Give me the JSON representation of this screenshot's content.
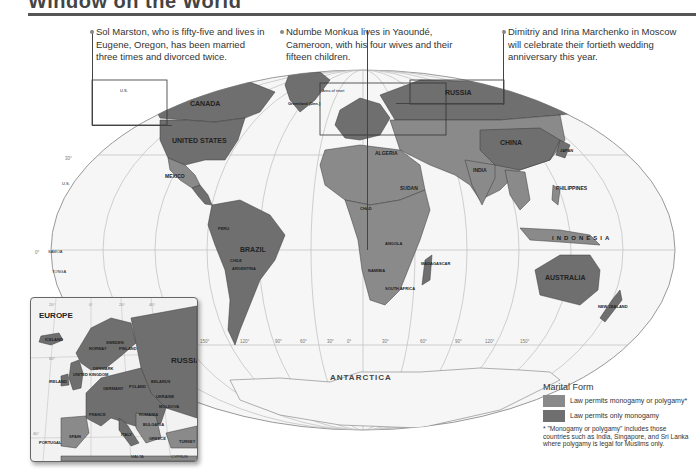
{
  "header": {
    "title": "Window on the World"
  },
  "callouts": [
    {
      "text": "Sol Marston, who is fifty-five and lives in Eugene, Oregon, has been married three times and divorced twice."
    },
    {
      "text": "Ndumbe Monkua lives in Yaoundé, Cameroon, with his four wives and their fifteen children."
    },
    {
      "text": "Dimitriy and Irina Marchenko in Moscow will celebrate their fortieth wedding anniversary this year."
    }
  ],
  "map": {
    "labels": {
      "canada": "CANADA",
      "united_states": "UNITED STATES",
      "mexico": "MEXICO",
      "brazil": "BRAZIL",
      "peru": "PERU",
      "bolivia": "BOLIVIA",
      "chile": "CHILE",
      "argentina": "ARGENTINA",
      "colombia": "COLOMBIA",
      "venezuela": "VENEZUELA",
      "ecuador": "ECUADOR",
      "paraguay": "PARAGUAY",
      "uruguay": "URUGUAY",
      "suriname": "SURINAME",
      "french_guiana": "French Guiana (Fr.)",
      "greenland": "Greenland (Den.)",
      "area_of_inset": "Area of inset",
      "russia": "RUSSIA",
      "china": "CHINA",
      "india": "INDIA",
      "mongolia": "MONGOLIA",
      "kazakhstan": "KAZAKHSTAN",
      "algeria": "ALGERIA",
      "libya": "LIBYA",
      "egypt": "EGYPT",
      "mali": "MALI",
      "niger": "NIGER",
      "chad": "CHAD",
      "sudan": "SUDAN",
      "ethiopia": "ETHIOPIA",
      "morocco": "MOROCCO",
      "western_sahara": "Western Sahara",
      "mauritania": "MAURITANIA",
      "saudi_arabia": "SAUDI ARABIA",
      "angola": "ANGOLA",
      "namibia": "NAMIBIA",
      "south_africa": "SOUTH AFRICA",
      "madagascar": "MADAGASCAR",
      "mozambique": "MOZAMBIQUE",
      "somalia": "SOMALIA",
      "indonesia": "INDONESIA",
      "philippines": "PHILIPPINES",
      "australia": "AUSTRALIA",
      "new_zealand": "NEW ZEALAND",
      "japan": "JAPAN",
      "vietnam": "VIETNAM",
      "malaysia": "MALAYSIA",
      "sri_lanka": "SRI LANKA",
      "maldives": "MALDIVES",
      "seychelles": "SEYCHELLES",
      "comoros": "COMOROS",
      "mauritius": "MAURITIUS",
      "palau": "PALAU",
      "micronesia": "FEDERATED STATES OF MICRONESIA",
      "marshall_islands": "MARSHALL ISLANDS",
      "solomon_islands": "SOLOMON ISLANDS",
      "vanuatu": "VANUATU",
      "new_caledonia": "New Caledonia (Fr.)",
      "samoa": "SAMOA",
      "tonga": "TONGA",
      "us_hawaii": "U.S.",
      "us_alaska": "U.S.",
      "antarctica": "ANTARCTICA",
      "guatemala": "GUATEMALA",
      "el_salvador": "EL SALVADOR",
      "honduras": "HONDURAS",
      "nicaragua": "NICARAGUA",
      "costa_rica": "COSTA RICA",
      "panama": "PANAMA",
      "cuba": "CUBA",
      "jamaica": "JAMAICA",
      "haiti": "HAITI",
      "bahamas": "BAHAMAS",
      "belize": "BELIZE"
    },
    "graticule": {
      "lat_30n": "30°",
      "lat_0": "0°",
      "lat_30s": "30°",
      "lon_labels": [
        "150°",
        "120°",
        "90°",
        "60°",
        "30°",
        "0°",
        "30°",
        "60°",
        "90°",
        "120°",
        "150°"
      ]
    }
  },
  "inset": {
    "title": "EUROPE",
    "labels": {
      "iceland": "ICELAND",
      "norway": "NORWAY",
      "sweden": "SWEDEN",
      "finland": "FINLAND",
      "russia": "RUSSIA",
      "ireland": "IRELAND",
      "uk": "UNITED KINGDOM",
      "denmark": "DENMARK",
      "germany": "GERMANY",
      "poland": "POLAND",
      "belarus": "BELARUS",
      "ukraine": "UKRAINE",
      "france": "FRANCE",
      "spain": "SPAIN",
      "portugal": "PORTUGAL",
      "italy": "ITALY",
      "romania": "ROMANIA",
      "bulgaria": "BULGARIA",
      "turkey": "TURKEY",
      "malta": "MALTA",
      "cyprus": "CYPRUS",
      "greece": "GREECE",
      "moldova": "MOLDOVA"
    },
    "graticule": [
      "20°",
      "0°",
      "20°",
      "40°",
      "60°",
      "40°"
    ]
  },
  "legend": {
    "title": "Marital Form",
    "items": [
      {
        "label": "Law permits monogamy or polygamy*",
        "color": "#8a8a8a"
      },
      {
        "label": "Law permits only monogamy",
        "color": "#6f6f6f"
      }
    ],
    "footnote": "* \"Monogamy or polygamy\" includes those countries such as India, Singapore, and Sri Lanka where polygamy is legal for Muslims only."
  },
  "colors": {
    "land_polygamy": "#8a8a8a",
    "land_monogamy": "#6f6f6f",
    "ocean": "#f4f4f4",
    "graticule": "#bdbdbd",
    "border": "#3a3a3a"
  }
}
